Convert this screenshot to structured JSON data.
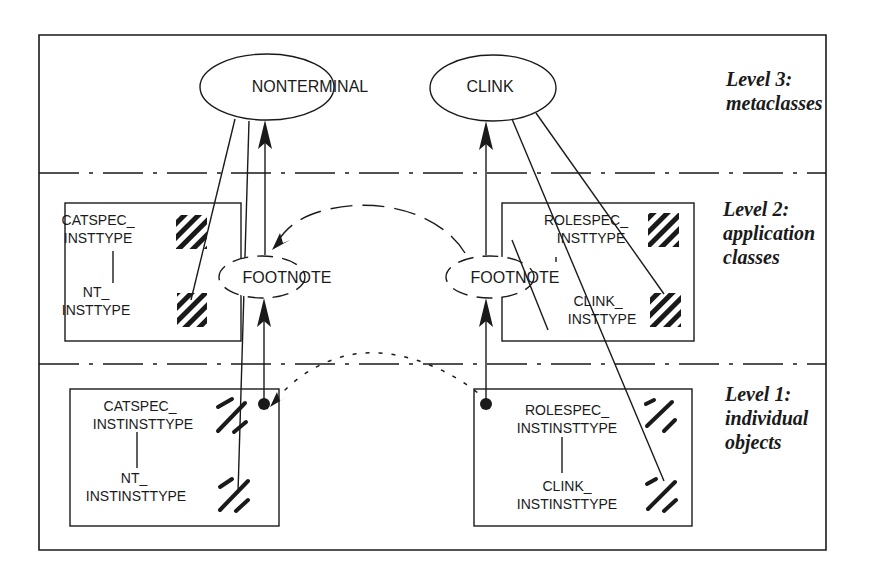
{
  "diagram": {
    "levels": [
      {
        "title": "Level 3:",
        "subtitle_lines": [
          "metaclasses"
        ]
      },
      {
        "title": "Level 2:",
        "subtitle_lines": [
          "application",
          "classes"
        ]
      },
      {
        "title": "Level 1:",
        "subtitle_lines": [
          "individual",
          "objects"
        ]
      }
    ],
    "metaclasses": {
      "nonterminal": "NONTERMINAL",
      "clink": "CLINK"
    },
    "footnotes": {
      "left": "FOOTNOTE",
      "right": "FOOTNOTE"
    },
    "application_classes": {
      "left": {
        "top": [
          "CATSPEC_",
          "INSTTYPE"
        ],
        "bottom": [
          "NT_",
          "INSTTYPE"
        ]
      },
      "right": {
        "top": [
          "ROLESPEC_",
          "INSTTYPE"
        ],
        "bottom": [
          "CLINK_",
          "INSTTYPE"
        ]
      }
    },
    "individual_objects": {
      "left": {
        "top": [
          "CATSPEC_",
          "INSTINSTTYPE"
        ],
        "bottom": [
          "NT_",
          "INSTINSTTYPE"
        ]
      },
      "right": {
        "top": [
          "ROLESPEC_",
          "INSTINSTTYPE"
        ],
        "bottom": [
          "CLINK_",
          "INSTINSTTYPE"
        ]
      }
    }
  }
}
